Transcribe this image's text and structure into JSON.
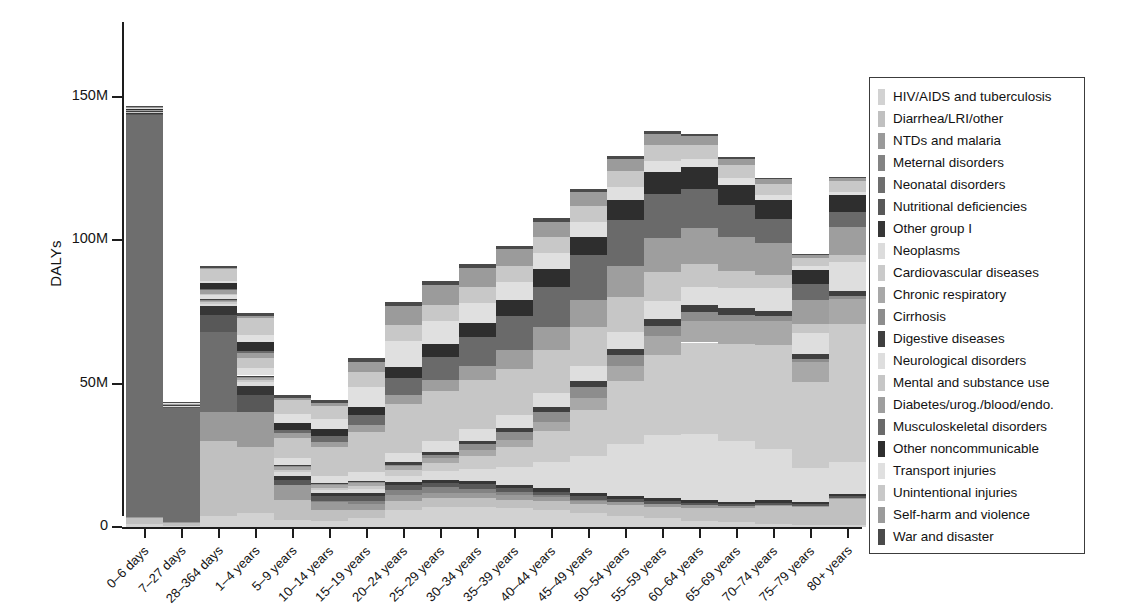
{
  "figure": {
    "ylabel": "DALYs",
    "y_ticks": [
      "0",
      "50M",
      "100M",
      "150M"
    ]
  },
  "legend": {
    "items": [
      {
        "label": "HIV/AIDS and tuberculosis",
        "color": "#d2d2d2"
      },
      {
        "label": "Diarrhea/LRI/other",
        "color": "#c0c0c0"
      },
      {
        "label": "NTDs and malaria",
        "color": "#9a9a9a"
      },
      {
        "label": "Meternal disorders",
        "color": "#838383"
      },
      {
        "label": "Neonatal disorders",
        "color": "#6e6e6e"
      },
      {
        "label": "Nutritional deficiencies",
        "color": "#585858"
      },
      {
        "label": "Other group I",
        "color": "#363636"
      },
      {
        "label": "Neoplasms",
        "color": "#dcdcdc"
      },
      {
        "label": "Cardiovascular diseases",
        "color": "#cacaca"
      },
      {
        "label": "Chronic respiratory",
        "color": "#a8a8a8"
      },
      {
        "label": "Cirrhosis",
        "color": "#8d8d8d"
      },
      {
        "label": "Digestive diseases",
        "color": "#3f3f3f"
      },
      {
        "label": "Neurological disorders",
        "color": "#dedede"
      },
      {
        "label": "Mental and substance use",
        "color": "#c6c6c6"
      },
      {
        "label": "Diabetes/urog./blood/endo.",
        "color": "#9e9e9e"
      },
      {
        "label": "Musculoskeletal disorders",
        "color": "#6a6a6a"
      },
      {
        "label": "Other noncommunicable",
        "color": "#2e2e2e"
      },
      {
        "label": "Transport injuries",
        "color": "#e0e0e0"
      },
      {
        "label": "Unintentional injuries",
        "color": "#c8c8c8"
      },
      {
        "label": "Self-harm and violence",
        "color": "#9b9b9b"
      },
      {
        "label": "War and disaster",
        "color": "#4a4a4a"
      }
    ]
  },
  "chart_data": {
    "type": "bar",
    "stacked": true,
    "title": "",
    "xlabel": "",
    "ylabel": "DALYs",
    "ylim": [
      0,
      176
    ],
    "yticks": [
      0,
      50,
      100,
      150
    ],
    "ytick_labels": [
      "0",
      "50M",
      "100M",
      "150M"
    ],
    "units": "millions of DALYs",
    "grid": false,
    "legend_position": "right",
    "categories": [
      "0–6 days",
      "7–27 days",
      "28–364 days",
      "1–4 years",
      "5–9 years",
      "10–14 years",
      "15–19 years",
      "20–24 years",
      "25–29 years",
      "30–34 years",
      "35–39 years",
      "40–44 years",
      "45–49 years",
      "50–54 years",
      "55–59 years",
      "60–64 years",
      "65–69 years",
      "70–74 years",
      "75–79 years",
      "80+ years"
    ],
    "totals": [
      175,
      53,
      167,
      175,
      67,
      61,
      81,
      110,
      117,
      122,
      128,
      135,
      144,
      151,
      158,
      143,
      127,
      123,
      96,
      133
    ],
    "series": [
      {
        "name": "HIV/AIDS and tuberculosis",
        "color": "#d2d2d2",
        "values": [
          1.0,
          0.3,
          4.0,
          5.0,
          2.5,
          2.0,
          3.0,
          6.0,
          7.0,
          7.0,
          6.5,
          6.0,
          5.0,
          4.0,
          3.0,
          2.2,
          1.6,
          1.2,
          0.8,
          0.7
        ]
      },
      {
        "name": "Diarrhea/LRI/other",
        "color": "#c0c0c0",
        "values": [
          2.0,
          1.0,
          26.0,
          23.0,
          7.0,
          4.0,
          3.0,
          3.0,
          3.0,
          3.0,
          3.0,
          3.0,
          3.0,
          3.5,
          4.0,
          4.5,
          5.0,
          6.0,
          6.0,
          9.0
        ]
      },
      {
        "name": "NTDs and malaria",
        "color": "#9a9a9a",
        "values": [
          0.5,
          0.3,
          10.0,
          12.0,
          5.0,
          3.0,
          2.0,
          2.0,
          2.0,
          2.0,
          1.8,
          1.6,
          1.4,
          1.2,
          1.0,
          0.8,
          0.6,
          0.5,
          0.4,
          0.3
        ]
      },
      {
        "name": "Meternal disorders",
        "color": "#838383",
        "values": [
          0.0,
          0.0,
          0.0,
          0.0,
          0.0,
          0.2,
          1.2,
          2.0,
          1.8,
          1.4,
          0.9,
          0.4,
          0.1,
          0.0,
          0.0,
          0.0,
          0.0,
          0.0,
          0.0,
          0.0
        ]
      },
      {
        "name": "Neonatal disorders",
        "color": "#6e6e6e",
        "values": [
          140.0,
          40.0,
          28.0,
          0.0,
          0.0,
          0.0,
          0.0,
          0.0,
          0.0,
          0.0,
          0.0,
          0.0,
          0.0,
          0.0,
          0.0,
          0.0,
          0.0,
          0.0,
          0.0,
          0.0
        ]
      },
      {
        "name": "Nutritional deficiencies",
        "color": "#585858",
        "values": [
          0.5,
          0.3,
          6.0,
          6.0,
          2.0,
          1.5,
          1.5,
          1.5,
          1.5,
          1.5,
          1.4,
          1.3,
          1.2,
          1.1,
          1.0,
          0.9,
          0.8,
          0.8,
          0.7,
          0.8
        ]
      },
      {
        "name": "Other group I",
        "color": "#363636",
        "values": [
          0.5,
          0.3,
          3.0,
          3.0,
          1.2,
          1.0,
          1.0,
          1.2,
          1.2,
          1.2,
          1.2,
          1.2,
          1.1,
          1.0,
          1.0,
          0.9,
          0.8,
          0.8,
          0.7,
          0.8
        ]
      },
      {
        "name": "Neoplasms",
        "color": "#dcdcdc",
        "values": [
          0.1,
          0.1,
          0.8,
          1.5,
          1.5,
          1.2,
          1.5,
          2.2,
          3.0,
          4.2,
          6.0,
          9.0,
          13.0,
          18.0,
          22.0,
          23.0,
          21.0,
          18.0,
          12.0,
          11.0
        ]
      },
      {
        "name": "Cardiovascular diseases",
        "color": "#cacaca",
        "values": [
          0.2,
          0.1,
          0.5,
          0.6,
          0.5,
          0.6,
          1.0,
          1.8,
          2.8,
          4.5,
          7.0,
          11.0,
          16.0,
          22.0,
          28.0,
          32.0,
          34.0,
          36.0,
          30.0,
          48.0
        ]
      },
      {
        "name": "Chronic respiratory",
        "color": "#a8a8a8",
        "values": [
          0.1,
          0.1,
          0.6,
          1.0,
          1.2,
          1.2,
          1.2,
          1.4,
          1.6,
          2.0,
          2.4,
          3.0,
          4.0,
          5.2,
          6.5,
          7.5,
          8.0,
          8.5,
          7.0,
          9.0
        ]
      },
      {
        "name": "Cirrhosis",
        "color": "#8d8d8d",
        "values": [
          0.0,
          0.0,
          0.2,
          0.2,
          0.2,
          0.2,
          0.3,
          0.6,
          1.2,
          2.0,
          2.8,
          3.5,
          4.0,
          4.0,
          3.6,
          3.0,
          2.2,
          1.6,
          1.0,
          0.8
        ]
      },
      {
        "name": "Digestive diseases",
        "color": "#3f3f3f",
        "values": [
          0.1,
          0.1,
          0.4,
          0.5,
          0.4,
          0.4,
          0.5,
          0.8,
          1.0,
          1.2,
          1.5,
          1.8,
          2.0,
          2.2,
          2.4,
          2.4,
          2.2,
          2.0,
          1.6,
          1.8
        ]
      },
      {
        "name": "Neurological disorders",
        "color": "#dedede",
        "values": [
          0.2,
          0.1,
          1.2,
          2.5,
          2.6,
          2.6,
          3.0,
          3.4,
          3.8,
          4.2,
          4.6,
          5.0,
          5.4,
          5.8,
          6.2,
          6.6,
          7.0,
          8.0,
          7.5,
          10.0
        ]
      },
      {
        "name": "Mental and substance use",
        "color": "#c6c6c6",
        "values": [
          0.0,
          0.0,
          0.5,
          3.5,
          7.0,
          10.0,
          14.0,
          17.0,
          17.5,
          17.0,
          16.0,
          15.0,
          13.5,
          12.0,
          10.0,
          8.0,
          6.0,
          4.5,
          3.0,
          2.5
        ]
      },
      {
        "name": "Diabetes/urog./blood/endo.",
        "color": "#9e9e9e",
        "values": [
          0.3,
          0.2,
          1.5,
          2.0,
          1.8,
          1.8,
          2.2,
          3.0,
          4.0,
          5.0,
          6.5,
          8.0,
          9.5,
          11.0,
          12.0,
          12.5,
          12.0,
          11.0,
          8.5,
          10.0
        ]
      },
      {
        "name": "Musculoskeletal disorders",
        "color": "#6a6a6a",
        "values": [
          0.0,
          0.0,
          0.2,
          0.6,
          1.0,
          2.0,
          3.5,
          6.0,
          8.0,
          10.0,
          12.0,
          14.0,
          15.5,
          16.0,
          15.5,
          13.5,
          11.0,
          8.5,
          5.5,
          5.0
        ]
      },
      {
        "name": "Other noncommunicable",
        "color": "#2e2e2e",
        "values": [
          0.3,
          0.2,
          2.0,
          3.0,
          2.5,
          2.5,
          3.0,
          4.0,
          4.5,
          5.0,
          5.5,
          6.0,
          6.5,
          7.0,
          7.5,
          7.5,
          7.0,
          6.5,
          5.0,
          6.0
        ]
      },
      {
        "name": "Transport injuries",
        "color": "#e0e0e0",
        "values": [
          0.1,
          0.1,
          1.0,
          2.5,
          3.0,
          3.5,
          7.0,
          9.0,
          8.0,
          7.0,
          6.2,
          5.6,
          5.0,
          4.4,
          3.8,
          3.0,
          2.4,
          1.8,
          1.2,
          1.0
        ]
      },
      {
        "name": "Unintentional injuries",
        "color": "#c8c8c8",
        "values": [
          0.5,
          0.3,
          4.0,
          6.0,
          5.0,
          4.5,
          5.0,
          5.5,
          5.5,
          5.5,
          5.5,
          5.5,
          5.5,
          5.5,
          5.5,
          5.0,
          4.5,
          4.0,
          3.0,
          4.0
        ]
      },
      {
        "name": "Self-harm and violence",
        "color": "#9b9b9b",
        "values": [
          0.1,
          0.1,
          0.3,
          0.5,
          0.6,
          1.0,
          3.5,
          6.5,
          7.0,
          6.5,
          6.0,
          5.5,
          5.0,
          4.5,
          4.0,
          3.0,
          2.2,
          1.6,
          1.0,
          1.0
        ]
      },
      {
        "name": "War and disaster",
        "color": "#4a4a4a",
        "values": [
          0.2,
          0.1,
          0.8,
          1.2,
          1.0,
          1.0,
          1.4,
          1.6,
          1.5,
          1.4,
          1.3,
          1.2,
          1.1,
          1.0,
          0.9,
          0.7,
          0.5,
          0.4,
          0.3,
          0.3
        ]
      }
    ]
  }
}
